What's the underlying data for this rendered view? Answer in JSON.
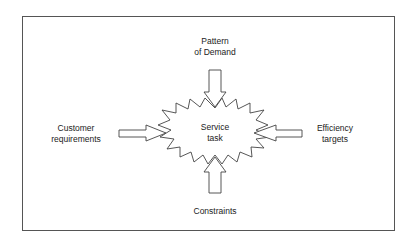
{
  "diagram": {
    "center": {
      "line1": "Service",
      "line2": "task"
    },
    "inputs": {
      "top": {
        "line1": "Pattern",
        "line2": "of Demand"
      },
      "left": {
        "line1": "Customer",
        "line2": "requirements"
      },
      "right": {
        "line1": "Efficiency",
        "line2": "targets"
      },
      "bottom": {
        "line1": "Constraints"
      }
    },
    "colors": {
      "stroke": "#444444",
      "background": "#ffffff",
      "frame": "#555555"
    }
  }
}
